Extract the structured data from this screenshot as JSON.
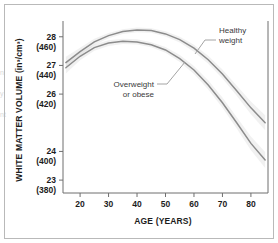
{
  "figure": {
    "edge_bleed_text": "n\ny\nnt"
  },
  "chart_data": {
    "type": "line",
    "title": "",
    "xlabel": "AGE (YEARS)",
    "ylabel": "WHITE MATTER VOLUME (in³/cm³)",
    "xlim": [
      14,
      86
    ],
    "ylim": [
      22.4,
      28.9
    ],
    "grid": false,
    "legend_position": "inline-annotations",
    "xticks": [
      20,
      30,
      40,
      50,
      60,
      70,
      80
    ],
    "xtick_labels": [
      "20",
      "30",
      "40",
      "50",
      "60",
      "70",
      "80"
    ],
    "yticks": [
      28,
      27,
      26,
      24,
      23
    ],
    "ytick_labels": [
      {
        "primary": "28",
        "secondary": "(460)"
      },
      {
        "primary": "27",
        "secondary": "(440)"
      },
      {
        "primary": "26",
        "secondary": "(420)"
      },
      {
        "primary": "24",
        "secondary": "(400)"
      },
      {
        "primary": "23",
        "secondary": "(380)"
      }
    ],
    "annotations": [
      {
        "name": "healthy-weight",
        "text_line1": "Healthy",
        "text_line2": "weight"
      },
      {
        "name": "overweight-or-obese",
        "text_line1": "Overweight",
        "text_line2": "or obese"
      }
    ],
    "colors": {
      "curve": "#8c8c8c",
      "band": "#bdbdbd",
      "axis": "#6f6f6f",
      "text": "#1c1c1c",
      "frame": "#b9b9b9"
    },
    "x": [
      15,
      20,
      25,
      30,
      35,
      40,
      45,
      50,
      55,
      60,
      65,
      70,
      75,
      80,
      85
    ],
    "series": [
      {
        "name": "Healthy weight",
        "values": [
          27.1,
          27.48,
          27.82,
          28.04,
          28.18,
          28.24,
          28.22,
          28.1,
          27.9,
          27.6,
          27.2,
          26.7,
          26.12,
          25.52,
          25.0
        ],
        "band_upper": [
          27.3,
          27.62,
          27.93,
          28.13,
          28.26,
          28.32,
          28.3,
          28.19,
          28.0,
          27.72,
          27.34,
          26.86,
          26.3,
          25.74,
          25.26
        ],
        "band_lower": [
          26.9,
          27.34,
          27.71,
          27.95,
          28.1,
          28.16,
          28.14,
          28.01,
          27.8,
          27.48,
          27.06,
          26.54,
          25.94,
          25.3,
          24.74
        ]
      },
      {
        "name": "Overweight or obese",
        "values": [
          26.92,
          27.32,
          27.62,
          27.78,
          27.84,
          27.82,
          27.72,
          27.54,
          27.24,
          26.84,
          26.32,
          25.7,
          25.0,
          24.28,
          23.7
        ],
        "band_upper": [
          27.12,
          27.46,
          27.73,
          27.88,
          27.93,
          27.91,
          27.81,
          27.64,
          27.36,
          26.98,
          26.48,
          25.88,
          25.2,
          24.52,
          23.98
        ],
        "band_lower": [
          26.72,
          27.18,
          27.51,
          27.68,
          27.75,
          27.73,
          27.63,
          27.44,
          27.12,
          26.7,
          26.16,
          25.52,
          24.8,
          24.04,
          23.42
        ]
      }
    ]
  }
}
